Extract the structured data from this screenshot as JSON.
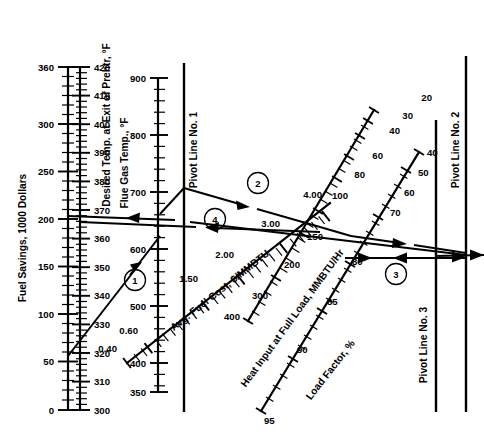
{
  "figure": {
    "type": "nomogram"
  },
  "scales": {
    "fuel_savings": {
      "title": "Fuel Savings, 1000 Dollars",
      "unit": "1000 Dollars",
      "orientation": "vertical",
      "min": 0,
      "max": 360,
      "labels": [
        "360",
        "300",
        "250",
        "200",
        "150",
        "100",
        "50",
        "0"
      ],
      "label_values": [
        360,
        300,
        250,
        200,
        150,
        100,
        50,
        0
      ]
    },
    "desired_temp": {
      "title": "Desired Temp. at Exit of Prehtr, °F",
      "unit": "°F",
      "orientation": "vertical",
      "min": 300,
      "max": 420,
      "labels": [
        "420",
        "410",
        "400",
        "390",
        "380",
        "370",
        "360",
        "350",
        "340",
        "330",
        "320",
        "310",
        "300"
      ],
      "label_values": [
        420,
        410,
        400,
        390,
        380,
        370,
        360,
        350,
        340,
        330,
        320,
        310,
        300
      ]
    },
    "flue_gas_temp": {
      "title": "Flue Gas Temp., °F",
      "unit": "°F",
      "orientation": "vertical",
      "min": 350,
      "max": 900,
      "labels": [
        "900",
        "800",
        "700",
        "600",
        "500",
        "400",
        "350"
      ],
      "label_values": [
        900,
        800,
        700,
        600,
        500,
        400,
        350
      ]
    },
    "fuel_cost": {
      "title": "Avg. Fuel Cost, $/MMBTU",
      "unit": "$/MMBTU",
      "orientation": "diagonal",
      "min": 0.4,
      "max": 4.0,
      "labels": [
        "0.40",
        "0.60",
        "1.50",
        "2.00",
        "3.00",
        "4.00"
      ],
      "label_values": [
        0.4,
        0.6,
        1.5,
        2.0,
        3.0,
        4.0
      ]
    },
    "heat_input": {
      "title": "Heat Input at Full Load, MMBTU/Hr",
      "unit": "MMBTU/Hr",
      "orientation": "diagonal",
      "min": 20,
      "max": 400,
      "labels": [
        "400",
        "300",
        "200",
        "150",
        "100",
        "80",
        "60",
        "40",
        "30",
        "20"
      ],
      "label_values": [
        400,
        300,
        200,
        150,
        100,
        80,
        60,
        40,
        30,
        20
      ]
    },
    "load_factor": {
      "title": "Load Factor, %",
      "unit": "%",
      "orientation": "diagonal",
      "min": 40,
      "max": 95,
      "labels": [
        "40",
        "50",
        "60",
        "70",
        "80",
        "85",
        "90",
        "95"
      ],
      "label_values": [
        40,
        50,
        60,
        70,
        80,
        85,
        90,
        95
      ]
    }
  },
  "pivot_lines": [
    {
      "id": "pivot1",
      "label": "Pivot Line No. 1"
    },
    {
      "id": "pivot2",
      "label": "Pivot Line No. 2"
    },
    {
      "id": "pivot3",
      "label": "Pivot Line No. 3"
    }
  ],
  "steps": [
    {
      "id": "step1",
      "label": "1"
    },
    {
      "id": "step2",
      "label": "2"
    },
    {
      "id": "step3",
      "label": "3"
    },
    {
      "id": "step4",
      "label": "4"
    }
  ],
  "colors": {
    "ink": "#000000",
    "background": "#ffffff"
  }
}
